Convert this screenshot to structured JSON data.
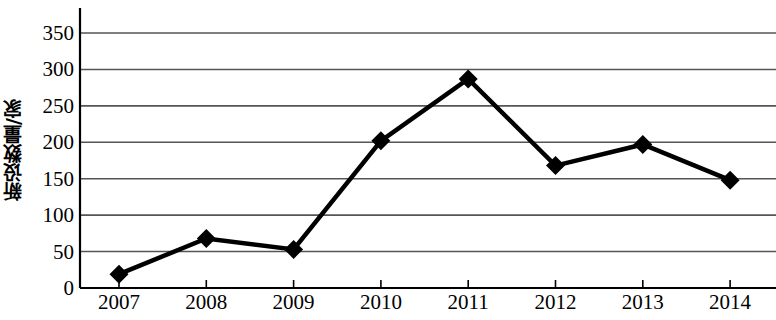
{
  "chart_data": {
    "type": "line",
    "title": "",
    "xlabel": "",
    "ylabel": "新设数量/家",
    "categories": [
      "2007",
      "2008",
      "2009",
      "2010",
      "2011",
      "2012",
      "2013",
      "2014"
    ],
    "values": [
      19,
      68,
      53,
      202,
      287,
      168,
      197,
      148
    ],
    "series": [
      {
        "name": "新设数量/家",
        "values": [
          19,
          68,
          53,
          202,
          287,
          168,
          197,
          148
        ]
      }
    ],
    "ylim": [
      0,
      350
    ],
    "y_ticks": [
      0,
      50,
      100,
      150,
      200,
      250,
      300,
      350
    ],
    "y_tick_labels": [
      "0",
      "50",
      "100",
      "150",
      "200",
      "250",
      "300",
      "350"
    ],
    "grid": "horizontal",
    "legend": "none",
    "marker": "diamond",
    "line_color": "#000000",
    "marker_color": "#000000",
    "grid_color": "#555555",
    "axis_color": "#000000",
    "background_color": "#ffffff"
  }
}
